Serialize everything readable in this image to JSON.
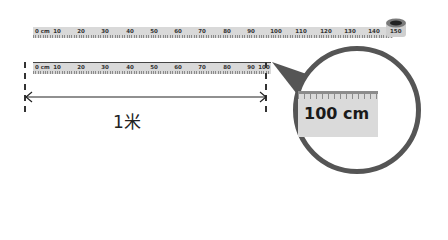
{
  "top_tape": {
    "labels": [
      "0 cm",
      "10",
      "20",
      "30",
      "40",
      "50",
      "60",
      "70",
      "80",
      "90",
      "100",
      "110",
      "120",
      "130",
      "140",
      "150"
    ]
  },
  "bottom_tape": {
    "labels": [
      "0 cm",
      "10",
      "20",
      "30",
      "40",
      "50",
      "60",
      "70",
      "80",
      "90",
      "100"
    ]
  },
  "measurement": {
    "label": "1米"
  },
  "magnifier": {
    "text": "100 cm"
  },
  "colors": {
    "tape": "#d9d9d9",
    "circle_border": "#555555",
    "text": "#222222"
  }
}
